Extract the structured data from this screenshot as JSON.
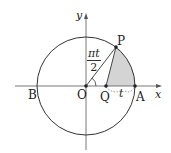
{
  "diagram": {
    "type": "unit-circle-geometry",
    "axes": {
      "x_label": "x",
      "y_label": "y"
    },
    "points": {
      "O": {
        "label": "O"
      },
      "A": {
        "label": "A"
      },
      "B": {
        "label": "B"
      },
      "P": {
        "label": "P"
      },
      "Q": {
        "label": "Q"
      }
    },
    "angle_label": {
      "numerator": "πt",
      "denominator": "2"
    },
    "segment_label": "t",
    "colors": {
      "stroke": "#333333",
      "shade": "#d4d4d4",
      "background": "#ffffff"
    }
  }
}
